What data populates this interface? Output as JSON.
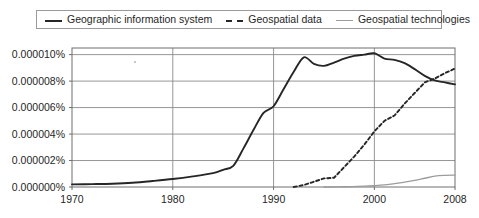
{
  "legend": {
    "position": "top",
    "items": [
      {
        "label": "Geographic information system",
        "style": "solid-dark",
        "color": "#262626"
      },
      {
        "label": "Geospatial data",
        "style": "dashed-dark",
        "color": "#262626"
      },
      {
        "label": "Geospatial technologies",
        "style": "solid-gray",
        "color": "#9c9c9c"
      }
    ]
  },
  "chart_data": {
    "type": "line",
    "title": "",
    "subtitle": "",
    "xlabel": "",
    "ylabel": "",
    "xlim": [
      1970,
      2008
    ],
    "ylim": [
      0.0,
      1.05e-05
    ],
    "grid": true,
    "y_tick_labels": [
      "0.000010%",
      "0.000008%",
      "0.000006%",
      "0.000004%",
      "0.000002%",
      "0.000000%"
    ],
    "y_tick_values": [
      1e-05,
      8e-06,
      6e-06,
      4e-06,
      2e-06,
      0.0
    ],
    "x_tick_labels": [
      "1970",
      "1980",
      "1990",
      "2000",
      "2008"
    ],
    "x_tick_values": [
      1970,
      1980,
      1990,
      2000,
      2008
    ],
    "series": [
      {
        "name": "Geographic information system",
        "style": "solid",
        "color": "#262626",
        "x": [
          1970,
          1972,
          1974,
          1976,
          1978,
          1980,
          1982,
          1984,
          1985,
          1986,
          1987,
          1988,
          1989,
          1990,
          1991,
          1992,
          1993,
          1994,
          1995,
          1996,
          1997,
          1998,
          1999,
          2000,
          2001,
          2002,
          2003,
          2004,
          2005,
          2006,
          2007,
          2008
        ],
        "y": [
          2e-07,
          2.2e-07,
          2.5e-07,
          3.2e-07,
          4.5e-07,
          6e-07,
          8e-07,
          1.05e-06,
          1.3e-06,
          1.6e-06,
          2.9e-06,
          4.3e-06,
          5.6e-06,
          6.1e-06,
          7.4e-06,
          8.7e-06,
          9.8e-06,
          9.3e-06,
          9.15e-06,
          9.4e-06,
          9.7e-06,
          9.9e-06,
          1e-05,
          1.01e-05,
          9.7e-06,
          9.6e-06,
          9.35e-06,
          8.9e-06,
          8.4e-06,
          8.05e-06,
          7.9e-06,
          7.75e-06
        ]
      },
      {
        "name": "Geospatial data",
        "style": "dashed",
        "color": "#262626",
        "x": [
          1992,
          1993,
          1994,
          1995,
          1996,
          1997,
          1998,
          1999,
          2000,
          2001,
          2002,
          2003,
          2004,
          2005,
          2006,
          2007,
          2008
        ],
        "y": [
          0.0,
          1.5e-07,
          4e-07,
          6.5e-07,
          7e-07,
          1.5e-06,
          2.3e-06,
          3.2e-06,
          4.2e-06,
          5e-06,
          5.4e-06,
          6.3e-06,
          7.1e-06,
          7.9e-06,
          8.2e-06,
          8.6e-06,
          8.95e-06
        ]
      },
      {
        "name": "Geospatial technologies",
        "style": "solid",
        "color": "#9c9c9c",
        "x": [
          1995,
          1997,
          1999,
          2000,
          2001,
          2002,
          2003,
          2004,
          2005,
          2006,
          2007,
          2008
        ],
        "y": [
          0.0,
          2e-08,
          6e-08,
          1e-07,
          1.6e-07,
          2.6e-07,
          3.6e-07,
          5e-07,
          6.6e-07,
          8.2e-07,
          8.8e-07,
          9e-07
        ]
      }
    ]
  },
  "colors": {
    "axis": "#6e6e6e",
    "grid": "#8a8a8a",
    "plot_background": "#ffffff",
    "text": "#1f1f1f"
  }
}
